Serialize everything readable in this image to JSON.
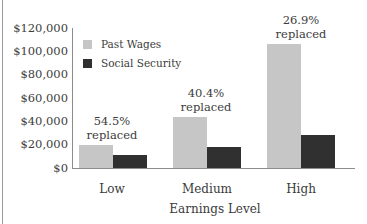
{
  "chart_data": {
    "type": "bar",
    "title": "",
    "xlabel": "Earnings Level",
    "ylabel": "",
    "categories": [
      "Low",
      "Medium",
      "High"
    ],
    "series": [
      {
        "name": "Past Wages",
        "color": "#c6c6c6",
        "values": [
          20000,
          44000,
          106000
        ]
      },
      {
        "name": "Social Security",
        "color": "#303030",
        "values": [
          10900,
          17800,
          28500
        ]
      }
    ],
    "annotations": [
      {
        "category": "Low",
        "line1": "54.5%",
        "line2": "replaced"
      },
      {
        "category": "Medium",
        "line1": "40.4%",
        "line2": "replaced"
      },
      {
        "category": "High",
        "line1": "26.9%",
        "line2": "replaced"
      }
    ],
    "yticks": [
      "$120,000",
      "$100,000",
      "$80,000",
      "$60,000",
      "$40,000",
      "$20,000",
      "$0"
    ],
    "ylim": [
      0,
      120000
    ],
    "grid": false,
    "legend_position": "upper-left-inside"
  }
}
